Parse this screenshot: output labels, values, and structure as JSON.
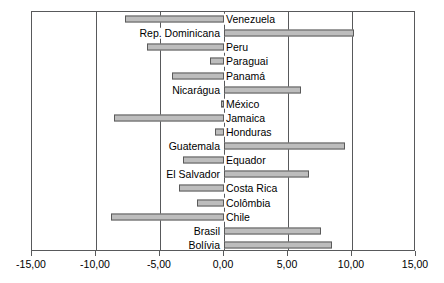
{
  "chart_data": {
    "type": "bar",
    "orientation": "horizontal",
    "title": "",
    "subtitle": "",
    "xlabel": "",
    "ylabel": "",
    "xlim": [
      -15,
      15
    ],
    "grid": true,
    "legend": null,
    "legend_position": "none",
    "decimal_separator": ",",
    "bar_color": "#bdbdbd",
    "bar_border_color": "#5a5a5a",
    "axis_color": "#58595b",
    "categories": [
      "Venezuela",
      "Rep. Dominicana",
      "Peru",
      "Paraguai",
      "Panamá",
      "Nicarágua",
      "México",
      "Jamaica",
      "Honduras",
      "Guatemala",
      "Equador",
      "El Salvador",
      "Costa Rica",
      "Colômbia",
      "Chile",
      "Brasil",
      "Bolívia"
    ],
    "values": [
      -7.7,
      10.15,
      -6.0,
      -1.1,
      -4.05,
      6.0,
      -0.25,
      -8.6,
      -0.7,
      9.45,
      -3.2,
      6.65,
      -3.5,
      -2.1,
      -8.8,
      7.6,
      8.45
    ],
    "xticks": [
      -15,
      -10,
      -5,
      0,
      5,
      10,
      15
    ],
    "xtick_labels": [
      "-15,00",
      "-10,00",
      "-5,00",
      "0,00",
      "5,00",
      "10,00",
      "15,00"
    ]
  }
}
